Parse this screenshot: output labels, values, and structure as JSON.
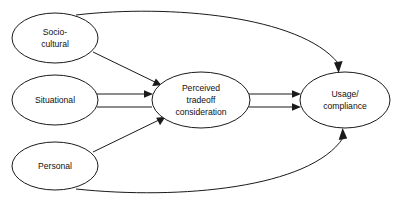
{
  "diagram": {
    "type": "path-model-diagram",
    "background_color": "#ffffff",
    "stroke_color": "#1a1a1a",
    "text_color": "#111111",
    "nodes": [
      {
        "id": "socio_cultural",
        "label_line1": "Socio-",
        "label_line2": "cultural",
        "shape": "ellipse",
        "cx": 55,
        "cy": 38,
        "rx": 43,
        "ry": 25
      },
      {
        "id": "situational",
        "label_line1": "Situational",
        "label_line2": "",
        "shape": "ellipse",
        "cx": 55,
        "cy": 100,
        "rx": 43,
        "ry": 25
      },
      {
        "id": "personal",
        "label_line1": "Personal",
        "label_line2": "",
        "shape": "ellipse",
        "cx": 55,
        "cy": 166,
        "rx": 43,
        "ry": 24
      },
      {
        "id": "perceived_tradeoff",
        "label_line1": "Perceived",
        "label_line2": "tradeoff",
        "label_line3": "consideration",
        "shape": "ellipse",
        "cx": 201,
        "cy": 100,
        "rx": 49,
        "ry": 28
      },
      {
        "id": "usage_compliance",
        "label_line1": "Usage/",
        "label_line2": "compliance",
        "shape": "ellipse",
        "cx": 345,
        "cy": 100,
        "rx": 45,
        "ry": 28
      }
    ],
    "edges": [
      {
        "id": "socio-to-perceived",
        "from": "socio_cultural",
        "to": "perceived_tradeoff",
        "style": "single-line-arrow"
      },
      {
        "id": "situational-to-perceived",
        "from": "situational",
        "to": "perceived_tradeoff",
        "style": "double-line-arrow"
      },
      {
        "id": "personal-to-perceived",
        "from": "personal",
        "to": "perceived_tradeoff",
        "style": "single-line-arrow"
      },
      {
        "id": "perceived-to-usage",
        "from": "perceived_tradeoff",
        "to": "usage_compliance",
        "style": "double-parallel-arrows"
      },
      {
        "id": "socio-to-usage",
        "from": "socio_cultural",
        "to": "usage_compliance",
        "style": "curved-arrow-over-top"
      },
      {
        "id": "personal-to-usage",
        "from": "personal",
        "to": "usage_compliance",
        "style": "curved-arrow-under-bottom"
      }
    ]
  }
}
